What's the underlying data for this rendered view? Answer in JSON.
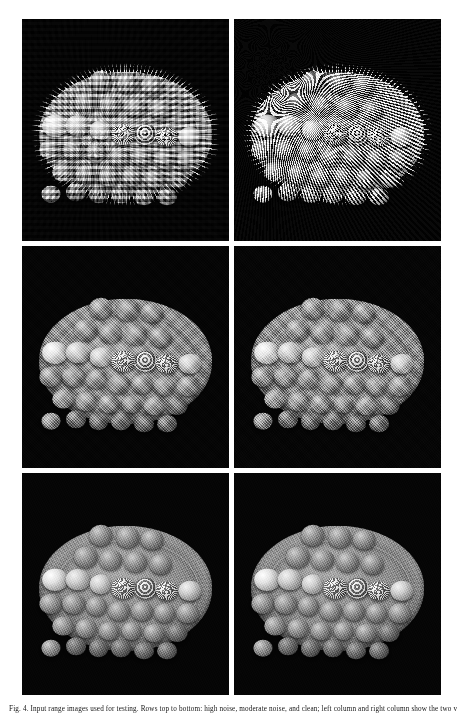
{
  "figure": {
    "caption": "Fig. 4.  Input range images used for testing. Rows top to bottom: high noise, moderate noise, and clean; left column and right column show the two views to be registered.",
    "panel_count": 6,
    "rows": 3,
    "columns": 2,
    "background_color": "#ffffff",
    "panel_background_color": "#050505",
    "panels": [
      {
        "id": "panel-row1-left",
        "row": 1,
        "column": "left",
        "label": "top-left",
        "scene": "range scan of a circular plate holding a grid of spheres",
        "noise_level": "high",
        "noise_type": "blocky",
        "description": "Heavily quantised, blocky range scan; plate silhouette is ragged and stair-stepped."
      },
      {
        "id": "panel-row1-right",
        "row": 1,
        "column": "right",
        "label": "top-right",
        "scene": "range scan of a circular plate holding a grid of spheres",
        "noise_level": "very-high",
        "noise_type": "fine-speckle",
        "description": "Dense fine-grained speckle noise; spheres barely separable from the plate."
      },
      {
        "id": "panel-row2-left",
        "row": 2,
        "column": "left",
        "label": "middle-left",
        "scene": "range scan of a circular plate holding a grid of spheres",
        "noise_level": "moderate",
        "noise_type": "grain",
        "description": "Moderately noisy scan; sphere shading and plate rim clearly visible."
      },
      {
        "id": "panel-row2-right",
        "row": 2,
        "column": "right",
        "label": "middle-right",
        "scene": "range scan of a circular plate holding a grid of spheres",
        "noise_level": "moderate-high",
        "noise_type": "grain",
        "description": "Coarse granular texture over the whole surface; geometry still recognisable."
      },
      {
        "id": "panel-row3-left",
        "row": 3,
        "column": "left",
        "label": "bottom-left",
        "scene": "range scan of a circular plate holding a grid of spheres",
        "noise_level": "clean",
        "noise_type": "none",
        "description": "Clean, smooth surface reconstruction with visible lathe striations on the plate."
      },
      {
        "id": "panel-row3-right",
        "row": 3,
        "column": "right",
        "label": "bottom-right",
        "scene": "range scan of a circular plate holding a grid of spheres",
        "noise_level": "clean",
        "noise_type": "none",
        "description": "Clean reconstruction of the second view, slightly rotated about the plate axis."
      }
    ],
    "balls": [
      {
        "cx": 16,
        "cy": 52,
        "r": 6.2,
        "tone": "bright"
      },
      {
        "cx": 27,
        "cy": 52,
        "r": 6.0,
        "tone": "light"
      },
      {
        "cx": 38,
        "cy": 50,
        "r": 5.4,
        "tone": "light"
      },
      {
        "cx": 49,
        "cy": 48,
        "r": 5.6,
        "tone": "rough"
      },
      {
        "cx": 60,
        "cy": 48,
        "r": 5.6,
        "tone": "rough2"
      },
      {
        "cx": 70,
        "cy": 47,
        "r": 5.4,
        "tone": "rough"
      },
      {
        "cx": 81,
        "cy": 47,
        "r": 5.6,
        "tone": "light"
      },
      {
        "cx": 14,
        "cy": 41,
        "r": 5.6,
        "tone": "mid"
      },
      {
        "cx": 25,
        "cy": 41,
        "r": 5.6,
        "tone": "mid"
      },
      {
        "cx": 36,
        "cy": 40,
        "r": 5.2,
        "tone": "mid"
      },
      {
        "cx": 47,
        "cy": 38,
        "r": 5.2,
        "tone": "mid"
      },
      {
        "cx": 58,
        "cy": 38,
        "r": 5.2,
        "tone": "mid"
      },
      {
        "cx": 69,
        "cy": 37,
        "r": 5.2,
        "tone": "mid"
      },
      {
        "cx": 80,
        "cy": 37,
        "r": 5.4,
        "tone": "mid"
      },
      {
        "cx": 20,
        "cy": 31,
        "r": 5.2,
        "tone": "mid"
      },
      {
        "cx": 31,
        "cy": 30,
        "r": 5.0,
        "tone": "mid"
      },
      {
        "cx": 42,
        "cy": 29,
        "r": 5.0,
        "tone": "mid"
      },
      {
        "cx": 53,
        "cy": 29,
        "r": 5.0,
        "tone": "mid"
      },
      {
        "cx": 64,
        "cy": 28,
        "r": 5.0,
        "tone": "mid"
      },
      {
        "cx": 75,
        "cy": 28,
        "r": 5.0,
        "tone": "dark"
      },
      {
        "cx": 26,
        "cy": 22,
        "r": 4.8,
        "tone": "dark"
      },
      {
        "cx": 37,
        "cy": 21,
        "r": 4.8,
        "tone": "dark"
      },
      {
        "cx": 48,
        "cy": 21,
        "r": 4.8,
        "tone": "dark"
      },
      {
        "cx": 59,
        "cy": 20,
        "r": 4.8,
        "tone": "dark"
      },
      {
        "cx": 70,
        "cy": 20,
        "r": 4.8,
        "tone": "dark"
      },
      {
        "cx": 31,
        "cy": 62,
        "r": 5.8,
        "tone": "mid"
      },
      {
        "cx": 43,
        "cy": 61,
        "r": 5.6,
        "tone": "mid"
      },
      {
        "cx": 55,
        "cy": 60,
        "r": 5.6,
        "tone": "mid"
      },
      {
        "cx": 67,
        "cy": 59,
        "r": 5.4,
        "tone": "mid"
      },
      {
        "cx": 38,
        "cy": 72,
        "r": 5.6,
        "tone": "mid"
      },
      {
        "cx": 51,
        "cy": 71,
        "r": 5.6,
        "tone": "mid"
      },
      {
        "cx": 63,
        "cy": 70,
        "r": 5.4,
        "tone": "mid"
      },
      {
        "cx": 14,
        "cy": 21,
        "r": 4.6,
        "tone": "mid"
      }
    ]
  }
}
